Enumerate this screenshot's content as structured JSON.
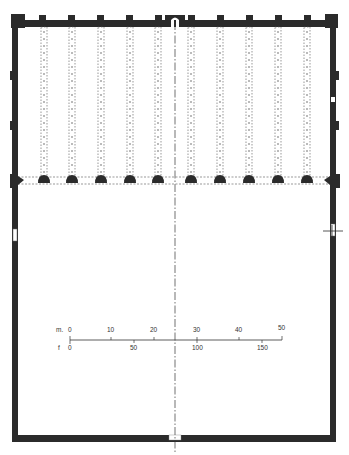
{
  "diagram": {
    "type": "architectural-floor-plan",
    "colors": {
      "wall": "#2b2b2b",
      "dotted": "#555555",
      "axis": "#333333",
      "background": "#ffffff"
    },
    "arcades": {
      "count": 10,
      "x_positions": [
        44,
        72,
        101,
        130,
        158,
        191,
        220,
        249,
        278,
        307
      ],
      "top_y": 27,
      "bottom_y": 178
    },
    "top_buttresses_x": [
      42,
      71,
      100,
      129,
      158,
      191,
      220,
      249,
      278,
      307
    ],
    "mihrab": {
      "x": 175,
      "label": "mihrab"
    },
    "central_axis_x": 175
  },
  "scale_bar": {
    "metric_unit": "m.",
    "imperial_unit": "f",
    "metric_ticks": [
      "0",
      "10",
      "20",
      "30",
      "40",
      "50"
    ],
    "imperial_ticks": [
      "0",
      "50",
      "100",
      "150"
    ]
  }
}
